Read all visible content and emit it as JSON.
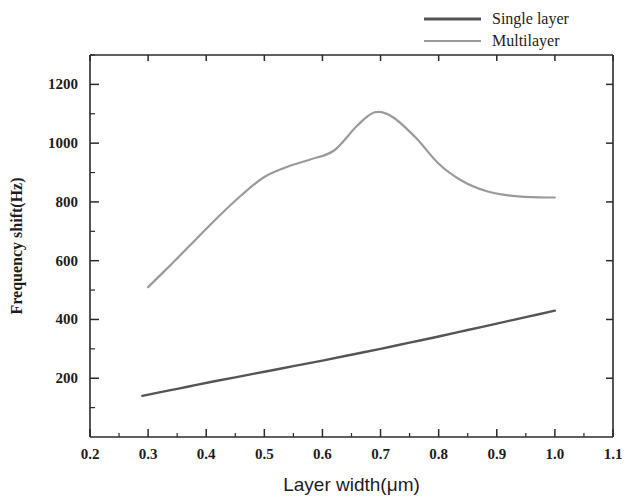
{
  "chart_data": {
    "type": "line",
    "title": "",
    "xlabel": "Layer width(μm)",
    "ylabel": "Frequency shift(Hz)",
    "xlim": [
      0.2,
      1.1
    ],
    "ylim": [
      0,
      1300
    ],
    "grid": false,
    "legend_position": "top-right",
    "x_ticks": [
      "0.2",
      "0.3",
      "0.4",
      "0.5",
      "0.6",
      "0.7",
      "0.8",
      "0.9",
      "1.0",
      "1.1"
    ],
    "x_tick_values": [
      0.2,
      0.3,
      0.4,
      0.5,
      0.6,
      0.7,
      0.8,
      0.9,
      1.0,
      1.1
    ],
    "x_minor_ticks": [
      0.25,
      0.35,
      0.45,
      0.55,
      0.65,
      0.75,
      0.85,
      0.95,
      1.05
    ],
    "y_ticks": [
      "200",
      "400",
      "600",
      "800",
      "1000",
      "1200"
    ],
    "y_tick_values": [
      200,
      400,
      600,
      800,
      1000,
      1200
    ],
    "y_minor_ticks": [
      100,
      300,
      500,
      700,
      900,
      1100,
      1300
    ],
    "series": [
      {
        "name": "Single layer",
        "color": "#555555",
        "width": 2.4,
        "x": [
          0.29,
          0.33,
          0.37,
          0.41,
          0.45,
          0.5,
          0.55,
          0.6,
          0.65,
          0.7,
          0.75,
          0.8,
          0.85,
          0.9,
          0.95,
          1.0
        ],
        "values": [
          140,
          156,
          172,
          188,
          203,
          222,
          241,
          260,
          280,
          300,
          321,
          342,
          364,
          386,
          408,
          430
        ]
      },
      {
        "name": "Multilayer",
        "color": "#9a9a9a",
        "width": 2.2,
        "x": [
          0.3,
          0.34,
          0.38,
          0.42,
          0.46,
          0.5,
          0.54,
          0.58,
          0.62,
          0.66,
          0.69,
          0.72,
          0.76,
          0.8,
          0.84,
          0.88,
          0.92,
          0.96,
          1.0
        ],
        "values": [
          510,
          588,
          668,
          748,
          822,
          885,
          920,
          945,
          975,
          1060,
          1105,
          1090,
          1020,
          930,
          872,
          838,
          822,
          816,
          815
        ]
      }
    ]
  },
  "legend": {
    "entries": [
      {
        "label": "Single layer",
        "color": "#555555"
      },
      {
        "label": "Multilayer",
        "color": "#9a9a9a"
      }
    ]
  }
}
